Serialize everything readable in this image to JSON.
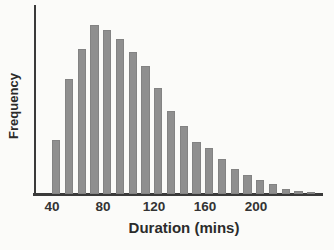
{
  "chart_data": {
    "type": "bar",
    "chart_kind": "histogram",
    "title": "",
    "xlabel": "Duration (mins)",
    "ylabel": "Frequency",
    "bin_start": 40,
    "bin_width": 10,
    "bin_labels": [
      "40-50",
      "50-60",
      "60-70",
      "70-80",
      "80-90",
      "90-100",
      "100-110",
      "110-120",
      "120-130",
      "130-140",
      "140-150",
      "150-160",
      "160-170",
      "170-180",
      "180-190",
      "190-200",
      "200-210",
      "210-220",
      "220-230",
      "230-240",
      "240-250"
    ],
    "values": [
      32,
      68,
      86,
      100,
      97,
      92,
      84,
      76,
      63,
      49,
      40,
      31,
      27,
      21,
      15,
      11,
      8,
      6,
      3,
      2,
      1
    ],
    "x_ticks": [
      40,
      80,
      120,
      160,
      200
    ],
    "y_tick_labels": [],
    "ylim": [
      0,
      100
    ],
    "grid": false,
    "legend": "none",
    "value_units": "relative bar height, tallest bar = 100 (y-axis has no numeric scale)"
  },
  "colors": {
    "background": "#fbfbf9",
    "bar_fill": "#8f8f8f",
    "axis": "#3a3a3a",
    "label_text": "#2b2b2b",
    "tick_text": "#333333"
  }
}
